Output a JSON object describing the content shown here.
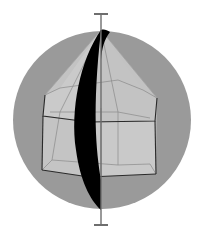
{
  "diagram": {
    "colors": {
      "background": "#ffffff",
      "sphere": "#9a9a9a",
      "polyhedron_fill": "#c4c4c4",
      "polyhedron_light": "#d2d2d2",
      "edge": "#2a2a2a",
      "hidden_edge": "#8a8a8a",
      "mirror_plane": "#000000",
      "axis": "#6e6e6e"
    },
    "sphere": {
      "cx": 102,
      "cy": 120,
      "r": 89
    },
    "axis": {
      "x": 101,
      "top_y": 14,
      "bottom_y": 225,
      "cap_half_width": 7
    },
    "apex": [
      101,
      30
    ],
    "top_ring": [
      [
        45,
        95
      ],
      [
        101,
        108
      ],
      [
        157,
        98
      ],
      [
        143,
        90
      ],
      [
        60,
        88
      ]
    ],
    "prism": {
      "top": [
        [
          43,
          116
        ],
        [
          89,
          122
        ],
        [
          155,
          121
        ],
        [
          157,
          98
        ],
        [
          45,
          95
        ]
      ],
      "bottom": [
        [
          42,
          170
        ],
        [
          89,
          177
        ],
        [
          156,
          174
        ],
        [
          150,
          164
        ],
        [
          52,
          160
        ]
      ]
    },
    "elements": [
      "sphere",
      "rotation-axis",
      "mirror-plane",
      "pentagonal-prism",
      "pentagonal-pyramid"
    ]
  }
}
